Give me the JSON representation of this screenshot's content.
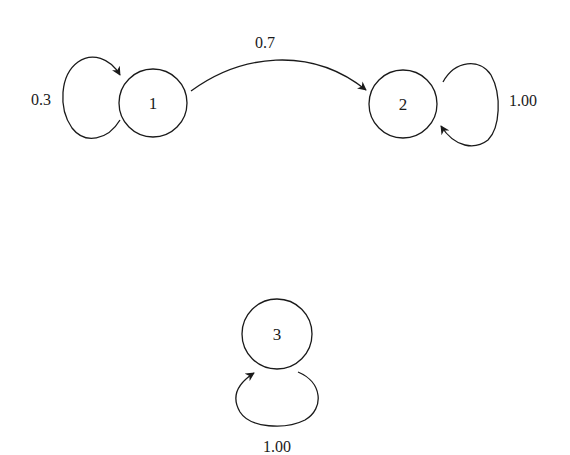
{
  "diagram": {
    "type": "markov-chain-state-diagram",
    "nodes": [
      {
        "id": "1",
        "label": "1",
        "cx": 153,
        "cy": 103,
        "r": 34
      },
      {
        "id": "2",
        "label": "2",
        "cx": 403,
        "cy": 104,
        "r": 34
      },
      {
        "id": "3",
        "label": "3",
        "cx": 277,
        "cy": 334,
        "r": 35
      }
    ],
    "edges": [
      {
        "from": "1",
        "to": "1",
        "label": "0.3"
      },
      {
        "from": "1",
        "to": "2",
        "label": "0.7"
      },
      {
        "from": "2",
        "to": "2",
        "label": "1.00"
      },
      {
        "from": "3",
        "to": "3",
        "label": "1.00"
      }
    ],
    "colors": {
      "stroke": "#1a1a1a",
      "background": "#ffffff"
    }
  }
}
